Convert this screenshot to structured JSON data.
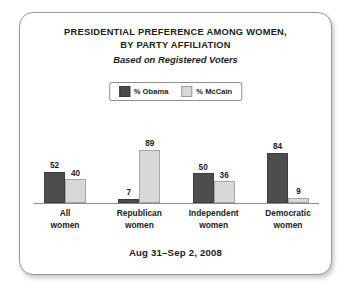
{
  "chart_data": {
    "type": "bar",
    "title": "PRESIDENTIAL PREFERENCE AMONG WOMEN, BY PARTY AFFILIATION",
    "title_line1": "PRESIDENTIAL PREFERENCE AMONG WOMEN,",
    "title_line2": "BY PARTY AFFILIATION",
    "subtitle": "Based on Registered Voters",
    "xlabel": "",
    "ylabel": "",
    "ylim": [
      0,
      100
    ],
    "grid": false,
    "legend_position": "top-center",
    "categories": [
      "All women",
      "Republican women",
      "Independent women",
      "Democratic women"
    ],
    "category_lines": [
      [
        "All",
        "women"
      ],
      [
        "Republican",
        "women"
      ],
      [
        "Independent",
        "women"
      ],
      [
        "Democratic",
        "women"
      ]
    ],
    "series": [
      {
        "name": "% Obama",
        "color": "#4d4d4d",
        "values": [
          52,
          7,
          50,
          84
        ]
      },
      {
        "name": "% McCain",
        "color": "#d8d8d8",
        "values": [
          40,
          89,
          36,
          9
        ]
      }
    ],
    "footnote": "Aug 31–Sep 2, 2008"
  },
  "legend": {
    "items": [
      {
        "label": "% Obama",
        "color": "#4d4d4d"
      },
      {
        "label": "% McCain",
        "color": "#d8d8d8"
      }
    ]
  },
  "footer": {
    "date_range": "Aug 31–Sep 2, 2008"
  },
  "colors": {
    "obama": "#4d4d4d",
    "mccain": "#d8d8d8",
    "axis": "#8b8b8b",
    "text": "#1c1c1c",
    "card_border": "#9a9a9a"
  }
}
